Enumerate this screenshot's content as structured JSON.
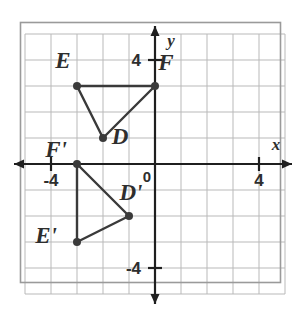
{
  "figure": {
    "background_color": "#ffffff",
    "grid": {
      "line_color": "#b9b9b9",
      "border_color": "#9a9a9a",
      "x_min": -5,
      "x_max": 5,
      "y_min": -5,
      "y_max": 5,
      "step": 1,
      "show": true
    },
    "axes": {
      "color": "#1f1f1f",
      "x_label": "x",
      "y_label": "y",
      "origin_label": "0",
      "x_ticks": [
        {
          "value": -4,
          "label": "-4"
        },
        {
          "value": 4,
          "label": "4"
        }
      ],
      "y_ticks": [
        {
          "value": 4,
          "label": "4"
        },
        {
          "value": -4,
          "label": "-4"
        }
      ]
    },
    "shapes": [
      {
        "name": "triangle-def",
        "stroke_color": "#3a3a3a",
        "vertices": [
          {
            "label": "D",
            "x": -2,
            "y": 1
          },
          {
            "label": "E",
            "x": -3,
            "y": 3
          },
          {
            "label": "F",
            "x": 0,
            "y": 3
          }
        ]
      },
      {
        "name": "triangle-def-prime",
        "stroke_color": "#3a3a3a",
        "vertices": [
          {
            "label": "D'",
            "x": -1,
            "y": -2
          },
          {
            "label": "E'",
            "x": -3,
            "y": -3
          },
          {
            "label": "F'",
            "x": -3,
            "y": 0
          }
        ]
      }
    ],
    "point_labels": [
      {
        "text": "E",
        "px": 63,
        "py": 68
      },
      {
        "text": "F",
        "px": 166,
        "py": 70
      },
      {
        "text": "D",
        "px": 120,
        "py": 144
      },
      {
        "text": "F'",
        "px": 56,
        "py": 157
      },
      {
        "text": "D'",
        "px": 131,
        "py": 200
      },
      {
        "text": "E'",
        "px": 46,
        "py": 243
      }
    ]
  },
  "chart_data": {
    "type": "scatter",
    "xlabel": "x",
    "ylabel": "y",
    "xlim": [
      -5,
      5
    ],
    "ylim": [
      -5,
      5
    ],
    "grid": true,
    "legend": "none",
    "xticks": [
      -4,
      4
    ],
    "yticks": [
      4,
      -4
    ],
    "series": [
      {
        "name": "Triangle DEF",
        "closed": true,
        "points": [
          {
            "label": "D",
            "x": -2,
            "y": 1
          },
          {
            "label": "E",
            "x": -3,
            "y": 3
          },
          {
            "label": "F",
            "x": 0,
            "y": 3
          }
        ]
      },
      {
        "name": "Triangle D'E'F'",
        "closed": true,
        "points": [
          {
            "label": "D'",
            "x": -1,
            "y": -2
          },
          {
            "label": "E'",
            "x": -3,
            "y": -3
          },
          {
            "label": "F'",
            "x": -3,
            "y": 0
          }
        ]
      }
    ]
  }
}
